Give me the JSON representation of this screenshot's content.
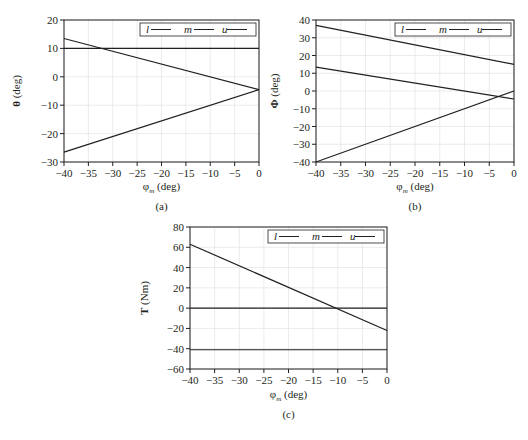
{
  "figure": {
    "panels": [
      {
        "id": "a",
        "caption": "(a)"
      },
      {
        "id": "b",
        "caption": "(b)"
      },
      {
        "id": "c",
        "caption": "(c)"
      }
    ]
  },
  "chart_data": [
    {
      "type": "line",
      "panel": "(a)",
      "title": "",
      "xlabel": "φm (deg)",
      "ylabel": "θ (deg)",
      "xlim": [
        -40,
        0
      ],
      "ylim": [
        -30,
        20
      ],
      "xticks": [
        -40,
        -35,
        -30,
        -25,
        -20,
        -15,
        -10,
        -5,
        0
      ],
      "yticks": [
        -30,
        -20,
        -10,
        0,
        10,
        20
      ],
      "grid": true,
      "legend": {
        "position": "top-right",
        "entries": [
          "l",
          "m",
          "u"
        ]
      },
      "x": [
        -40,
        0
      ],
      "series": [
        {
          "name": "upper sloped",
          "values": [
            13.5,
            -4.5
          ]
        },
        {
          "name": "horizontal",
          "values": [
            10,
            10
          ]
        },
        {
          "name": "lower sloped",
          "values": [
            -26.5,
            -4.5
          ]
        }
      ]
    },
    {
      "type": "line",
      "panel": "(b)",
      "title": "",
      "xlabel": "φm (deg)",
      "ylabel": "Φ (deg)",
      "xlim": [
        -40,
        0
      ],
      "ylim": [
        -40,
        40
      ],
      "xticks": [
        -40,
        -35,
        -30,
        -25,
        -20,
        -15,
        -10,
        -5,
        0
      ],
      "yticks": [
        -40,
        -30,
        -20,
        -10,
        0,
        10,
        20,
        30,
        40
      ],
      "grid": true,
      "legend": {
        "position": "top-right",
        "entries": [
          "l",
          "m",
          "u"
        ]
      },
      "x": [
        -40,
        0
      ],
      "series": [
        {
          "name": "top",
          "values": [
            37,
            15
          ]
        },
        {
          "name": "middle",
          "values": [
            13.5,
            -4.5
          ]
        },
        {
          "name": "bottom",
          "values": [
            -40,
            0
          ]
        }
      ]
    },
    {
      "type": "line",
      "panel": "(c)",
      "title": "",
      "xlabel": "φm (deg)",
      "ylabel": "T (Nm)",
      "xlim": [
        -40,
        0
      ],
      "ylim": [
        -60,
        80
      ],
      "xticks": [
        -40,
        -35,
        -30,
        -25,
        -20,
        -15,
        -10,
        -5,
        0
      ],
      "yticks": [
        -60,
        -40,
        -20,
        0,
        20,
        40,
        60,
        80
      ],
      "grid": true,
      "legend": {
        "position": "top-right",
        "entries": [
          "l",
          "m",
          "u"
        ]
      },
      "x": [
        -40,
        0
      ],
      "series": [
        {
          "name": "sloped",
          "values": [
            63,
            -22
          ]
        },
        {
          "name": "zero",
          "values": [
            0,
            0
          ]
        },
        {
          "name": "negative constant",
          "values": [
            -41,
            -41
          ]
        }
      ]
    }
  ],
  "layout": [
    {
      "left": 64,
      "top": 20,
      "width": 195,
      "height": 142,
      "labelX": 12,
      "captionY": 210,
      "axisLabelY": 190
    },
    {
      "left": 316,
      "top": 20,
      "width": 198,
      "height": 142,
      "labelX": 270,
      "captionY": 210,
      "axisLabelY": 190
    },
    {
      "left": 190,
      "top": 227,
      "width": 197,
      "height": 142,
      "labelX": 140,
      "captionY": 418,
      "axisLabelY": 398
    }
  ],
  "colors": {
    "line": "#231f20",
    "grid": "#e6e6e6",
    "axis": "#231f20"
  }
}
